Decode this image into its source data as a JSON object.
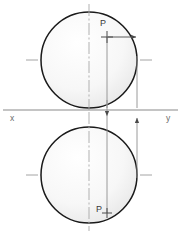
{
  "drawing": {
    "title": "Orthographic projection of point P",
    "background_color": "#ffffff",
    "circle_outline_color": "#1a1a1a",
    "circle_fill_start": "#ffffff",
    "circle_fill_end": "#ececec",
    "centerline_color": "#9a9a9a",
    "projection_line_color": "#8f8f8f",
    "reference_line_color": "#8a8a8a",
    "label_color": "#3a3a3a",
    "axis_label_color": "#6b6b6b"
  },
  "labels": {
    "point_top": "P",
    "point_bottom": "P",
    "axis_x": "x",
    "axis_y": "y"
  },
  "geometry": {
    "top_circle": {
      "center_x": 89,
      "center_y": 60,
      "radius": 48
    },
    "bottom_circle": {
      "center_x": 89,
      "center_y": 175,
      "radius": 48
    },
    "reference_line": {
      "y": 110,
      "x_start": 3,
      "x_end": 178
    },
    "vertical_centerline_x": 89,
    "projection_line_p_x": 107,
    "projection_line_edge_x": 137,
    "point_top_marker": {
      "x": 107,
      "y": 37
    },
    "point_bottom_marker": {
      "x": 107,
      "y": 212
    }
  }
}
